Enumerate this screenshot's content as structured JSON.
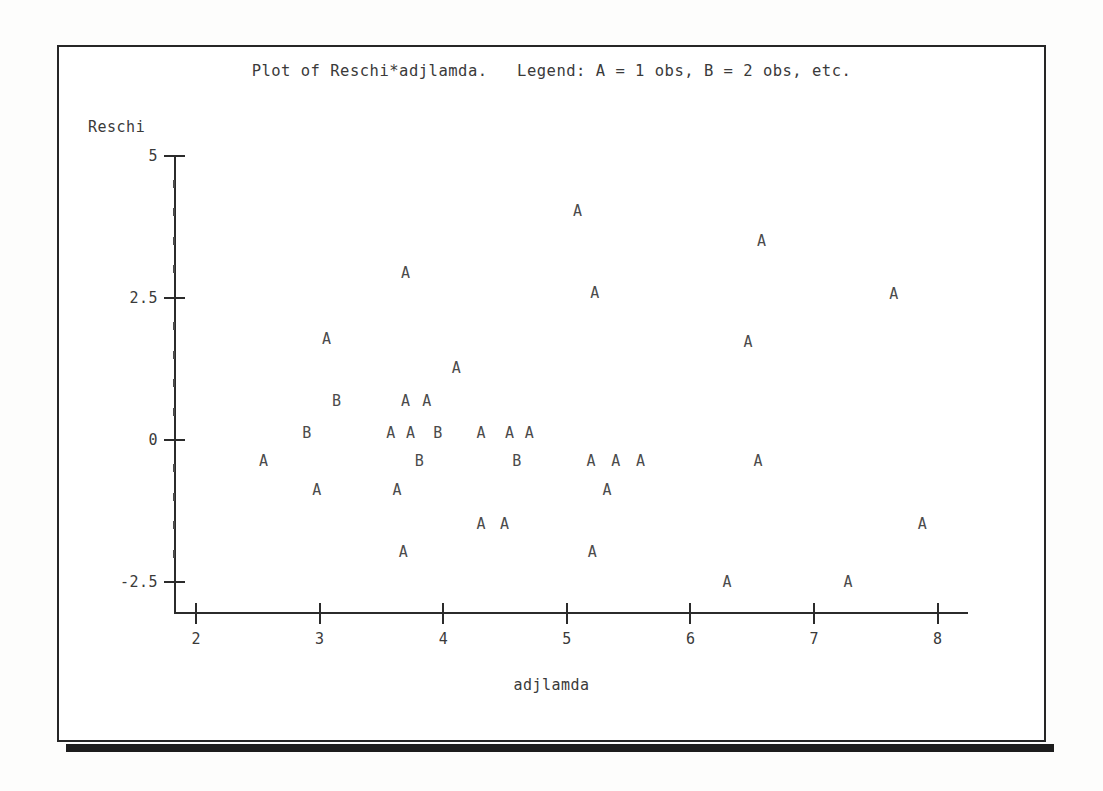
{
  "plot": {
    "title": "Plot of Reschi*adjlamda.   Legend: A = 1 obs, B = 2 obs, etc.",
    "x_axis_label": "adjlamda",
    "y_axis_label": "Reschi"
  },
  "chart_data": {
    "type": "scatter",
    "title": "Plot of Reschi*adjlamda.   Legend: A = 1 obs, B = 2 obs, etc.",
    "xlabel": "adjlamda",
    "ylabel": "Reschi",
    "legend": "A = 1 obs, B = 2 obs, etc.",
    "xlim": [
      1.82,
      8.25
    ],
    "ylim": [
      -2.78,
      5.3
    ],
    "xticks": [
      2,
      3,
      4,
      5,
      6,
      7,
      8
    ],
    "yticks": [
      5,
      2.5,
      0,
      -2.5
    ],
    "ytick_labels": [
      "5",
      "2.5",
      "0",
      "-2.5"
    ],
    "y_minor_ticks_between": 4,
    "grid": false,
    "legend_position": "in-title",
    "marker_font": "monospace-letter",
    "points": [
      {
        "label": "A",
        "x": 5.09,
        "y": 4.02
      },
      {
        "label": "A",
        "x": 6.58,
        "y": 3.49
      },
      {
        "label": "A",
        "x": 3.7,
        "y": 2.93
      },
      {
        "label": "A",
        "x": 5.23,
        "y": 2.59
      },
      {
        "label": "A",
        "x": 7.65,
        "y": 2.57
      },
      {
        "label": "A",
        "x": 3.06,
        "y": 1.77
      },
      {
        "label": "A",
        "x": 6.47,
        "y": 1.73
      },
      {
        "label": "A",
        "x": 4.11,
        "y": 1.27
      },
      {
        "label": "B",
        "x": 3.14,
        "y": 0.68
      },
      {
        "label": "A",
        "x": 3.7,
        "y": 0.68
      },
      {
        "label": "A",
        "x": 3.87,
        "y": 0.68
      },
      {
        "label": "B",
        "x": 2.9,
        "y": 0.12
      },
      {
        "label": "A",
        "x": 3.58,
        "y": 0.12
      },
      {
        "label": "A",
        "x": 3.74,
        "y": 0.12
      },
      {
        "label": "B",
        "x": 3.96,
        "y": 0.12
      },
      {
        "label": "A",
        "x": 4.31,
        "y": 0.12
      },
      {
        "label": "A",
        "x": 4.54,
        "y": 0.12
      },
      {
        "label": "A",
        "x": 4.7,
        "y": 0.12
      },
      {
        "label": "A",
        "x": 2.55,
        "y": -0.37
      },
      {
        "label": "B",
        "x": 3.81,
        "y": -0.37
      },
      {
        "label": "B",
        "x": 4.6,
        "y": -0.37
      },
      {
        "label": "A",
        "x": 5.2,
        "y": -0.37
      },
      {
        "label": "A",
        "x": 5.4,
        "y": -0.37
      },
      {
        "label": "A",
        "x": 5.6,
        "y": -0.37
      },
      {
        "label": "A",
        "x": 6.55,
        "y": -0.37
      },
      {
        "label": "A",
        "x": 2.98,
        "y": -0.88
      },
      {
        "label": "A",
        "x": 3.63,
        "y": -0.88
      },
      {
        "label": "A",
        "x": 5.33,
        "y": -0.88
      },
      {
        "label": "A",
        "x": 4.31,
        "y": -1.47
      },
      {
        "label": "A",
        "x": 4.5,
        "y": -1.47
      },
      {
        "label": "A",
        "x": 7.88,
        "y": -1.47
      },
      {
        "label": "A",
        "x": 3.68,
        "y": -1.97
      },
      {
        "label": "A",
        "x": 5.21,
        "y": -1.97
      },
      {
        "label": "A",
        "x": 6.3,
        "y": -2.5
      },
      {
        "label": "A",
        "x": 7.28,
        "y": -2.5
      }
    ]
  }
}
